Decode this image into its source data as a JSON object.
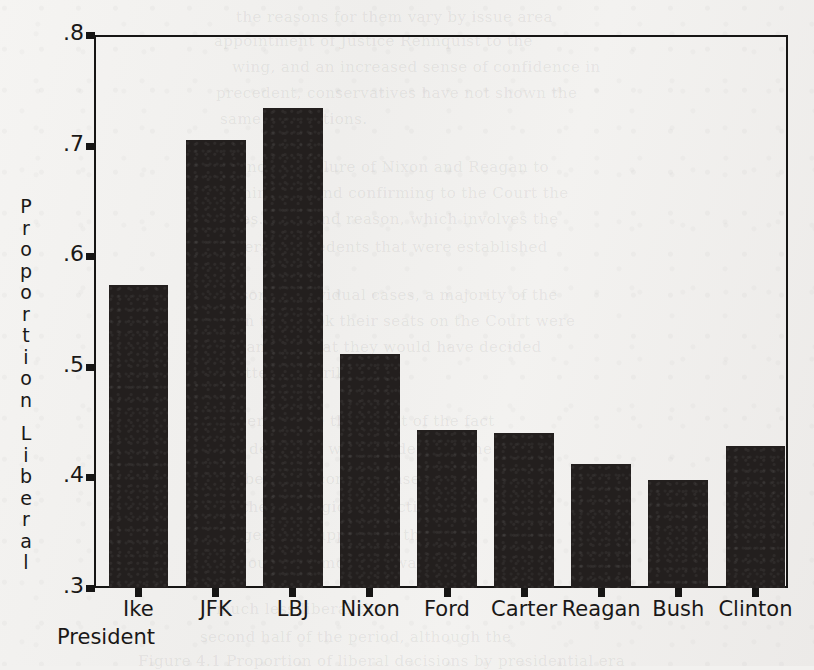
{
  "chart_data": {
    "type": "bar",
    "title": "",
    "subtitle": "",
    "xlabel": "President",
    "ylabel": "Proportion Liberal",
    "ylabel_stacked": [
      "P",
      "r",
      "o",
      "p",
      "o",
      "r",
      "t",
      "i",
      "o",
      "n",
      "",
      "L",
      "i",
      "b",
      "e",
      "r",
      "a",
      "l"
    ],
    "categories": [
      "Ike",
      "JFK",
      "LBJ",
      "Nixon",
      "Ford",
      "Carter",
      "Reagan",
      "Bush",
      "Clinton"
    ],
    "values": [
      0.574,
      0.705,
      0.734,
      0.512,
      0.443,
      0.44,
      0.412,
      0.398,
      0.428
    ],
    "ylim": [
      0.3,
      0.8
    ],
    "yticks": [
      0.3,
      0.4,
      0.5,
      0.6,
      0.7,
      0.8
    ],
    "ytick_labels": [
      ".3",
      ".4",
      ".5",
      ".6",
      ".7",
      ".8"
    ],
    "grid": false,
    "legend": false,
    "legend_position": "none",
    "bar_color": "#231f1e",
    "axis_color": "#161514",
    "background_color": "#f2f1ef"
  },
  "bleed_text": [
    {
      "text": "the reasons for them vary by issue area",
      "x": 236,
      "y": 8
    },
    {
      "text": "appointment of Justice Rehnquist to the",
      "x": 214,
      "y": 32
    },
    {
      "text": "wing, and an increased sense of confidence in",
      "x": 232,
      "y": 58
    },
    {
      "text": "precedent, conservatives have not shown the",
      "x": 216,
      "y": 84
    },
    {
      "text": "same conventions.",
      "x": 220,
      "y": 110
    },
    {
      "text": "Beyond the failure of Nixon and Reagan to",
      "x": 208,
      "y": 158
    },
    {
      "text": "nominating and confirming to the Court the",
      "x": 218,
      "y": 184
    },
    {
      "text": "judges. A second reason, which involves the",
      "x": 206,
      "y": 210
    },
    {
      "text": "liberal precedents that were established",
      "x": 224,
      "y": 238
    },
    {
      "text": "in some individual cases, a majority of the",
      "x": 220,
      "y": 286
    },
    {
      "text": "when they took their seats on the Court were",
      "x": 212,
      "y": 312
    },
    {
      "text": "than 200 that they would have decided",
      "x": 230,
      "y": 338
    },
    {
      "text": "pattern is striking.",
      "x": 226,
      "y": 364
    },
    {
      "text": "seems to be the result of the fact",
      "x": 230,
      "y": 412
    },
    {
      "text": "the decisions were made at a time",
      "x": 218,
      "y": 440
    },
    {
      "text": "liberal outcome in cases that",
      "x": 234,
      "y": 470
    },
    {
      "text": "the ideological direction",
      "x": 242,
      "y": 498
    },
    {
      "text": "a general support for the",
      "x": 228,
      "y": 526
    },
    {
      "text": "Court had moved toward",
      "x": 236,
      "y": 554
    },
    {
      "text": "much less liberal than",
      "x": 216,
      "y": 600
    },
    {
      "text": "second half of the period, although the",
      "x": 200,
      "y": 628
    },
    {
      "text": "Figure 4.1   Proportion of liberal decisions by presidential era",
      "x": 138,
      "y": 652
    }
  ]
}
